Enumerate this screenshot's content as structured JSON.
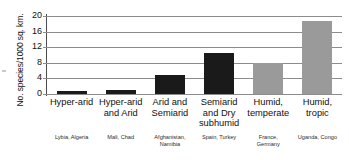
{
  "chart_data": {
    "type": "bar",
    "title": "",
    "xlabel": "",
    "ylabel": "No. species/1000 sq. km.",
    "ylim": [
      0,
      20
    ],
    "yticks": [
      0,
      4,
      8,
      12,
      16,
      20
    ],
    "grid": true,
    "legend": "none",
    "categories": [
      "Hyper-arid",
      "Hyper-arid and Arid",
      "Arid and Semiarid",
      "Semiarid and Dry subhumid",
      "Humid, temperate",
      "Humid, tropic"
    ],
    "category_lines": [
      [
        "Hyper-arid"
      ],
      [
        "Hyper-arid",
        "and Arid"
      ],
      [
        "Arid and",
        "Semiarid"
      ],
      [
        "Semiarid",
        "and Dry",
        "subhumid"
      ],
      [
        "Humid,",
        "temperate"
      ],
      [
        "Humid,",
        "tropic"
      ]
    ],
    "values": [
      0.9,
      1.1,
      5.0,
      10.5,
      8.0,
      18.8
    ],
    "bar_colors": [
      "#1a1a1a",
      "#1a1a1a",
      "#1a1a1a",
      "#1a1a1a",
      "#9a9a9a",
      "#9a9a9a"
    ],
    "country_labels": [
      [
        "Lybia, Algeria"
      ],
      [
        "Mali, Chad"
      ],
      [
        "Afghanistan,",
        "Namibia"
      ],
      [
        "Spain, Turkey"
      ],
      [
        "France,",
        "Germany"
      ],
      [
        "Uganda, Congo"
      ]
    ],
    "colors": {
      "dryland_bar": "#1a1a1a",
      "humid_bar": "#9a9a9a",
      "gridline": "#8c8c8c",
      "axis": "#4d4d4d",
      "background": "#ffffff",
      "text": "#111111"
    }
  }
}
